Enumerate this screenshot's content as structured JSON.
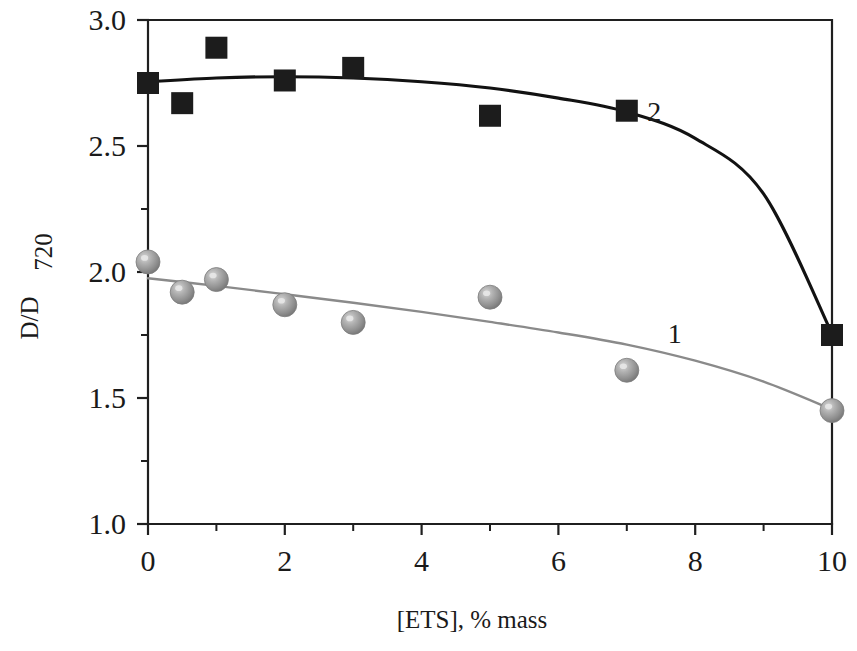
{
  "chart_data": {
    "type": "scatter",
    "title": "",
    "xlabel": "[ETS], % mass",
    "ylabel": "D/D",
    "ylabel_sub": "720",
    "xlim": [
      0,
      10
    ],
    "ylim": [
      1.0,
      3.0
    ],
    "x_ticks": [
      0,
      2,
      4,
      6,
      8,
      10
    ],
    "x_tick_labels": [
      "0",
      "2",
      "4",
      "6",
      "8",
      "10"
    ],
    "x_minor_ticks": [
      1,
      3,
      5,
      7,
      9
    ],
    "y_ticks": [
      1.0,
      1.5,
      2.0,
      2.5,
      3.0
    ],
    "y_tick_labels": [
      "1.0",
      "1.5",
      "2.0",
      "2.5",
      "3.0"
    ],
    "y_minor_ticks": [
      1.25,
      1.75,
      2.25,
      2.75
    ],
    "grid": false,
    "legend_position": "inline-annotation",
    "series": [
      {
        "name": "2",
        "label": "2",
        "marker": "square",
        "color": "#1c1c1c",
        "x": [
          0,
          0.5,
          1,
          2,
          3,
          5,
          7,
          10
        ],
        "values": [
          2.75,
          2.67,
          2.89,
          2.76,
          2.81,
          2.62,
          2.64,
          1.75
        ],
        "fit_curve": [
          [
            0,
            2.755
          ],
          [
            1,
            2.77
          ],
          [
            2,
            2.775
          ],
          [
            3,
            2.77
          ],
          [
            4,
            2.755
          ],
          [
            5,
            2.73
          ],
          [
            6,
            2.69
          ],
          [
            7,
            2.635
          ],
          [
            8,
            2.53
          ],
          [
            9,
            2.31
          ],
          [
            10,
            1.755
          ]
        ]
      },
      {
        "name": "1",
        "label": "1",
        "marker": "sphere",
        "color": "#8a8a8a",
        "x": [
          0,
          0.5,
          1,
          2,
          3,
          5,
          7,
          10
        ],
        "values": [
          2.04,
          1.92,
          1.97,
          1.87,
          1.8,
          1.9,
          1.61,
          1.45
        ],
        "fit_curve": [
          [
            0,
            1.975
          ],
          [
            1,
            1.945
          ],
          [
            2,
            1.912
          ],
          [
            3,
            1.878
          ],
          [
            4,
            1.842
          ],
          [
            5,
            1.802
          ],
          [
            6,
            1.76
          ],
          [
            7,
            1.712
          ],
          [
            8,
            1.648
          ],
          [
            9,
            1.565
          ],
          [
            10,
            1.455
          ]
        ]
      }
    ],
    "annotations": [
      {
        "text": "2",
        "x": 7.4,
        "y": 2.6
      },
      {
        "text": "1",
        "x": 7.7,
        "y": 1.72
      }
    ]
  }
}
